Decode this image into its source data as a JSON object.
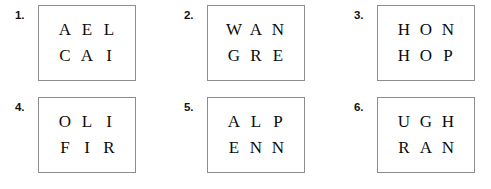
{
  "page": {
    "background_color": "#ffffff",
    "box_border_color": "#8d8d8d",
    "text_color": "#0b0b0b"
  },
  "puzzles": [
    {
      "number": "1.",
      "rows": [
        {
          "letters": [
            "A",
            "E",
            "L"
          ]
        },
        {
          "letters": [
            "C",
            "A",
            "I"
          ]
        }
      ]
    },
    {
      "number": "2.",
      "rows": [
        {
          "letters": [
            "W",
            "A",
            "N"
          ]
        },
        {
          "letters": [
            "G",
            "R",
            "E"
          ]
        }
      ]
    },
    {
      "number": "3.",
      "rows": [
        {
          "letters": [
            "H",
            "O",
            "N"
          ]
        },
        {
          "letters": [
            "H",
            "O",
            "P"
          ]
        }
      ]
    },
    {
      "number": "4.",
      "rows": [
        {
          "letters": [
            "O",
            "L",
            "I"
          ]
        },
        {
          "letters": [
            "F",
            "I",
            "R"
          ]
        }
      ]
    },
    {
      "number": "5.",
      "rows": [
        {
          "letters": [
            "A",
            "L",
            "P"
          ]
        },
        {
          "letters": [
            "E",
            "N",
            "N"
          ]
        }
      ]
    },
    {
      "number": "6.",
      "rows": [
        {
          "letters": [
            "U",
            "G",
            "H"
          ]
        },
        {
          "letters": [
            "R",
            "A",
            "N"
          ]
        }
      ]
    }
  ]
}
